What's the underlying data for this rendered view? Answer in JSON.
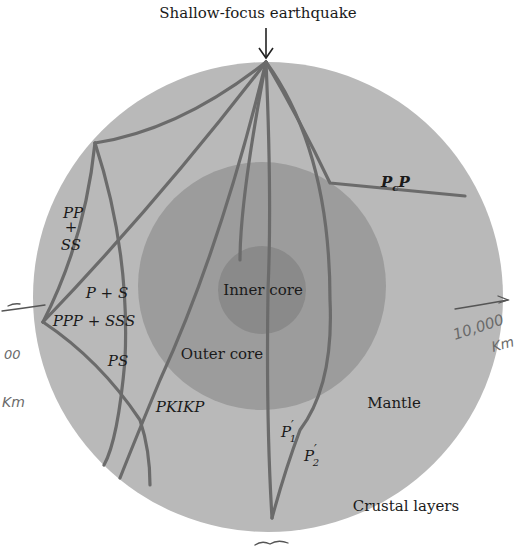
{
  "title": "Shallow-focus earthquake",
  "layers": {
    "inner_core": "Inner core",
    "outer_core": "Outer core",
    "mantle": "Mantle",
    "crust": "Crustal layers"
  },
  "rays": {
    "pcp": {
      "main": "P",
      "sub": "c",
      "tail": "P"
    },
    "pp_ss": {
      "line1": "PP",
      "line2": "+",
      "line3": "SS"
    },
    "p_s": "P + S",
    "ppp_sss": "PPP + SSS",
    "ps": "PS",
    "pkikp": "PKIKP",
    "p1": {
      "main": "P",
      "prime": "′",
      "sub": "1"
    },
    "p2": {
      "main": "P",
      "prime": "′",
      "sub": "2"
    }
  },
  "annotations": {
    "right_value": "10,000",
    "right_unit": "Km",
    "left_value": "00",
    "left_unit": "Km",
    "bottom_scribble": "~"
  },
  "colors": {
    "background": "#ffffff",
    "mantle": "#b9b9b9",
    "outer_core": "#9a9a9a",
    "inner_core": "#888888",
    "ray": "#6b6b6b",
    "text": "#1a1a1a"
  }
}
